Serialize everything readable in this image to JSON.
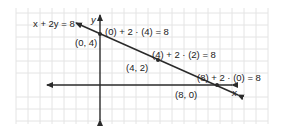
{
  "diagram": {
    "equation_label": "x + 2y = 8",
    "axis_labels": {
      "x": "x",
      "y": "y"
    },
    "points": [
      {
        "label": "(0, 4)",
        "check": "(0) + 2 · (4) = 8"
      },
      {
        "label": "(4, 2)",
        "check": "(4) + 2 · (2) = 8"
      },
      {
        "label": "(8, 0)",
        "check": "(8) + 2 · (0) = 8"
      }
    ],
    "colors": {
      "grid": "#e4e4e4",
      "line": "#2a2a2a",
      "text": "#222222"
    }
  }
}
